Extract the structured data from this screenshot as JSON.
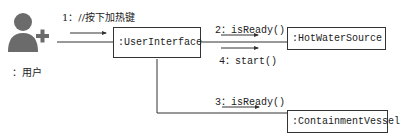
{
  "diagram": {
    "type": "UML communication diagram",
    "actor": {
      "label": "：用户",
      "icon": "user-add-icon"
    },
    "objects": [
      {
        "id": "ui",
        "label": ":UserInterface"
      },
      {
        "id": "hws",
        "label": ":HotWaterSource"
      },
      {
        "id": "cv",
        "label": ":ContainmentVessel"
      }
    ],
    "messages": [
      {
        "label": "1：//按下加热键",
        "from": "actor",
        "to": "ui"
      },
      {
        "label": "2：isReady()",
        "from": "ui",
        "to": "hws"
      },
      {
        "label": "4：start()",
        "from": "ui",
        "to": "hws"
      },
      {
        "label": "3：isReady()",
        "from": "ui",
        "to": "cv"
      }
    ],
    "colors": {
      "line": "#333333",
      "actor": "#6b6b6b",
      "text": "#222222"
    }
  }
}
